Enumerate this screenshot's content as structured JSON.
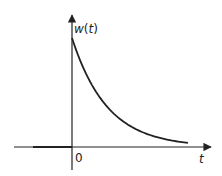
{
  "chart_data": {
    "type": "line",
    "title": "",
    "xlabel": "t",
    "ylabel": "w(t)",
    "x_tick_labels": [
      "0"
    ],
    "series": [
      {
        "name": "w(t)",
        "description": "Decaying exponential: zero for t<0, jumps to peak at t=0 then decays toward 0",
        "x": [
          -1.0,
          0.0,
          0.0,
          0.5,
          1.0,
          1.5,
          2.0,
          2.5,
          3.0,
          3.5,
          4.0
        ],
        "values": [
          0,
          0,
          1.0,
          0.67,
          0.45,
          0.3,
          0.2,
          0.13,
          0.09,
          0.06,
          0.04
        ]
      }
    ],
    "grid": false,
    "legend": "none"
  },
  "labels": {
    "y_axis": "w(t)",
    "x_axis": "t",
    "origin": "0"
  },
  "colors": {
    "stroke": "#222222",
    "background": "#ffffff"
  }
}
